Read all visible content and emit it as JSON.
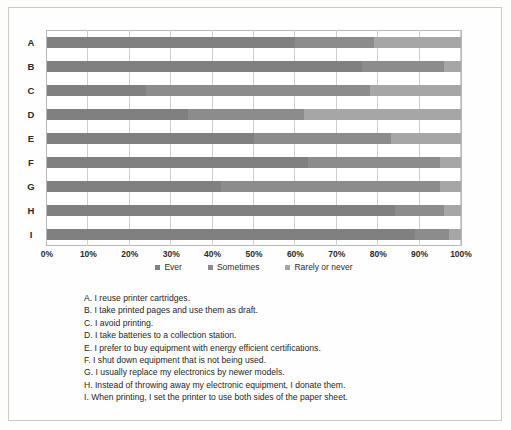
{
  "chart_data": {
    "type": "bar",
    "orientation": "horizontal",
    "stacked": true,
    "stacked_normalized": true,
    "title": "",
    "xlabel": "",
    "ylabel": "",
    "xlim": [
      0,
      100
    ],
    "xunit": "%",
    "grid": true,
    "legend_position": "bottom-center",
    "categories": [
      "A",
      "B",
      "C",
      "D",
      "E",
      "F",
      "G",
      "H",
      "I"
    ],
    "xticklabels": [
      "0%",
      "10%",
      "20%",
      "30%",
      "40%",
      "50%",
      "60%",
      "70%",
      "80%",
      "90%",
      "100%"
    ],
    "xtickvalues": [
      0,
      10,
      20,
      30,
      40,
      50,
      60,
      70,
      80,
      90,
      100
    ],
    "series": [
      {
        "name": "Ever",
        "color": "#808080",
        "values": [
          60,
          76,
          24,
          34,
          50,
          63,
          42,
          84,
          89
        ]
      },
      {
        "name": "Sometimes",
        "color": "#8c8c8c",
        "values": [
          19,
          20,
          54,
          28,
          33,
          32,
          53,
          12,
          8
        ]
      },
      {
        "name": "Rarely or never",
        "color": "#a6a6a6",
        "values": [
          21,
          4,
          22,
          38,
          17,
          5,
          5,
          4,
          3
        ]
      }
    ]
  },
  "legend": {
    "items": [
      {
        "label": "Ever",
        "color": "#808080"
      },
      {
        "label": "Sometimes",
        "color": "#8c8c8c"
      },
      {
        "label": "Rarely or never",
        "color": "#a6a6a6"
      }
    ]
  },
  "key_list": {
    "lines": [
      "A. I reuse printer cartridges.",
      "B. I take printed pages and use them as draft.",
      "C. I avoid printing.",
      "D. I take batteries to a collection station.",
      "E. I prefer to buy equipment with energy efficient certifications.",
      "F. I shut down equipment that is not being used.",
      "G. I usually replace my electronics by newer models.",
      "H. Instead of throwing away my electronic equipment, I donate them.",
      "I. When printing, I set the printer to use both sides of the paper sheet."
    ]
  }
}
